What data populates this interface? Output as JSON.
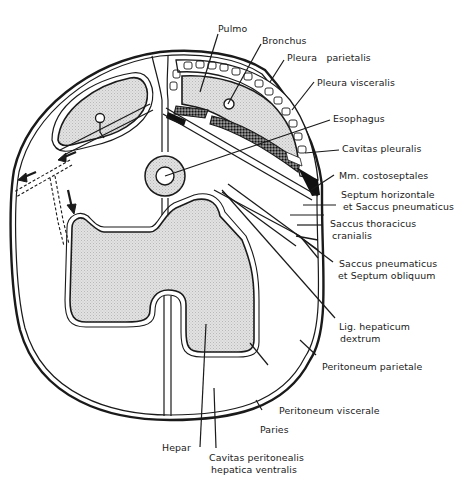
{
  "figure": {
    "type": "anatomical cross-section",
    "labels": {
      "pulmo": "Pulmo",
      "bronchus": "Bronchus",
      "pleura_parietalis": "Pleura   parietalis",
      "pleura_visceralis": "Pleura visceralis",
      "esophagus": "Esophagus",
      "cavitas_pleuralis": "Cavitas pleuralis",
      "mm_costoseptales": "Mm. costoseptales",
      "septum_horizontale_1": "Septum horizontale",
      "septum_horizontale_2": "et Saccus pneumaticus",
      "saccus_thoracicus_1": "Saccus thoracicus",
      "saccus_thoracicus_2": "cranialis",
      "saccus_pneumaticus_1": "Saccus pneumaticus",
      "saccus_pneumaticus_2": "et Septum obliquum",
      "lig_hepaticum_1": "Lig. hepaticum",
      "lig_hepaticum_2": "dextrum",
      "peritoneum_parietale": "Peritoneum parietale",
      "peritoneum_viscerale": "Peritoneum viscerale",
      "paries": "Paries",
      "hepar": "Hepar",
      "cavitas_peritonealis_1": "Cavitas peritonealis",
      "cavitas_peritonealis_2": "hepatica ventralis"
    },
    "colors": {
      "line": "#1a1a1a",
      "organ_fill": "#dcdcdc",
      "muscle_fill": "#111111",
      "background": "#ffffff"
    }
  }
}
